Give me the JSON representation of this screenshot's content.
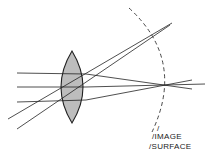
{
  "diagram": {
    "colors": {
      "background": "#ffffff",
      "line": "#222222",
      "lens_fill": "#bdbdbd",
      "dashed_surface": "#333333"
    },
    "lens": {
      "shape": "biconvex",
      "top": [
        72,
        51
      ],
      "bottom": [
        72,
        123
      ],
      "left_bulge_x": 56,
      "right_bulge_x": 88
    },
    "rays": [
      {
        "name": "axial-ray-top",
        "from": [
          17,
          73
        ],
        "via": [
          86,
          74
        ],
        "to": [
          192,
          89
        ]
      },
      {
        "name": "axial-ray-center",
        "from": [
          17,
          87
        ],
        "via": [
          86,
          87
        ],
        "to": [
          205,
          84
        ]
      },
      {
        "name": "axial-ray-bottom",
        "from": [
          17,
          102
        ],
        "via": [
          86,
          100
        ],
        "to": [
          192,
          80
        ]
      },
      {
        "name": "oblique-ray-1",
        "from": [
          8,
          119
        ],
        "to": [
          172,
          23
        ]
      },
      {
        "name": "oblique-ray-2",
        "from": [
          17,
          129
        ],
        "to": [
          170,
          25
        ]
      }
    ],
    "image_surface": {
      "style": "dashed-arc",
      "start": [
        129,
        8
      ],
      "mid": [
        168,
        85
      ],
      "end": [
        152,
        132
      ]
    },
    "labels": {
      "slash_mark": "/",
      "line1": "/IMAGE",
      "line2": "/SURFACE"
    }
  }
}
